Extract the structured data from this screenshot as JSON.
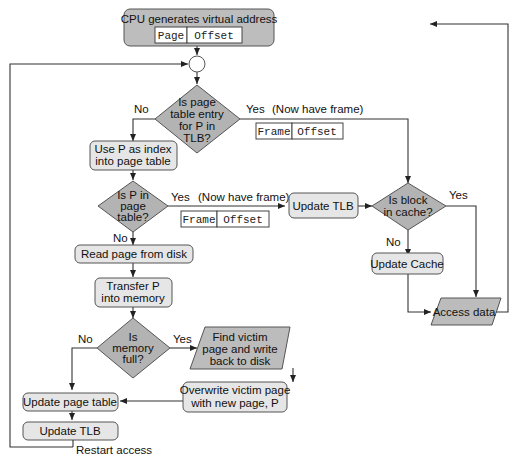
{
  "diagram": {
    "start": {
      "label": "CPU generates virtual address",
      "fields": [
        "Page",
        "Offset"
      ]
    },
    "decisions": {
      "tlb": {
        "lines": [
          "Is page",
          "table entry",
          "for P in",
          "TLB?"
        ],
        "no": "No",
        "yes": "Yes",
        "note": "(Now have frame)",
        "fields": [
          "Frame",
          "Offset"
        ]
      },
      "page_table": {
        "lines": [
          "Is P in",
          "page",
          "table?"
        ],
        "no": "No",
        "yes": "Yes",
        "note": "(Now have frame)",
        "fields": [
          "Frame",
          "Offset"
        ]
      },
      "cache": {
        "lines": [
          "Is block",
          "in cache?"
        ],
        "no": "No",
        "yes": "Yes"
      },
      "memory": {
        "lines": [
          "Is",
          "memory",
          "full?"
        ],
        "no": "No",
        "yes": "Yes"
      }
    },
    "processes": {
      "use_p": [
        "Use P as index",
        "into page table"
      ],
      "update_tlb_1": "Update TLB",
      "update_cache": "Update Cache",
      "read_page": "Read page from disk",
      "transfer": [
        "Transfer P",
        "into memory"
      ],
      "overwrite": [
        "Overwrite victim page",
        "with new page, P"
      ],
      "update_pt": "Update page table",
      "update_tlb_2": "Update TLB"
    },
    "io": {
      "access_data": "Access data",
      "find_victim": [
        "Find victim",
        "page and write",
        "back to disk"
      ]
    },
    "restart": "Restart access"
  }
}
